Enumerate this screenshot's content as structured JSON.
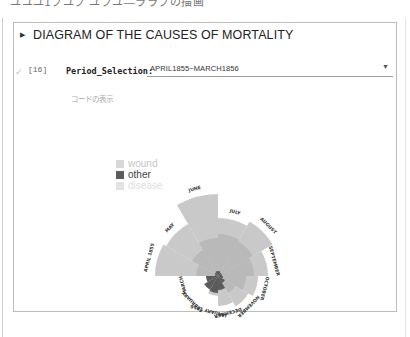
{
  "top_clipped_text": "ユユユ1ブユブ ユブユ—ララブの描画",
  "cell": {
    "title": "DIAGRAM OF THE CAUSES OF MORTALITY",
    "collapse_icon": "caret-right-icon",
    "exec_status_icon": "check-icon",
    "exec_count": "[16]",
    "widget": {
      "label": "Period_Selection:",
      "selected_value": "APRIL1855~MARCH1856",
      "arrow_icon": "caret-down-icon"
    },
    "show_code_label": "コードの表示"
  },
  "colors": {
    "disease": "#c9c9c9",
    "wound": "#b9b9b9",
    "other": "#5b5b5b",
    "legend_wound": "#d7d7d7",
    "legend_other": "#5b5b5b",
    "legend_disease": "#e3e3e3"
  },
  "legend": [
    {
      "label": "wound",
      "text_color": "#c6c6c6"
    },
    {
      "label": "other",
      "text_color": "#444444"
    },
    {
      "label": "disease",
      "text_color": "#dedede"
    }
  ],
  "chart_data": {
    "type": "polar-area",
    "title": "DIAGRAM OF THE CAUSES OF MORTALITY",
    "period": "APRIL1855~MARCH1856",
    "categories": [
      "APRIL 1855",
      "MAY",
      "JUNE",
      "JULY",
      "AUGUST",
      "SEPTEMBER",
      "OCTOBER",
      "NOVEMBER",
      "DECEMBER",
      "JANUARY 1856",
      "FEBRUARY",
      "MARCH"
    ],
    "series": [
      {
        "name": "disease",
        "values": [
          63,
          60,
          82,
          58,
          63,
          50,
          40,
          35,
          30,
          20,
          12,
          8
        ]
      },
      {
        "name": "wound",
        "values": [
          22,
          30,
          38,
          42,
          40,
          36,
          28,
          20,
          15,
          10,
          6,
          4
        ]
      },
      {
        "name": "other",
        "values": [
          3,
          4,
          5,
          5,
          4,
          4,
          5,
          8,
          14,
          17,
          16,
          12
        ]
      }
    ],
    "legend_position": "upper-left",
    "units": "relative radius (px, estimated)"
  }
}
